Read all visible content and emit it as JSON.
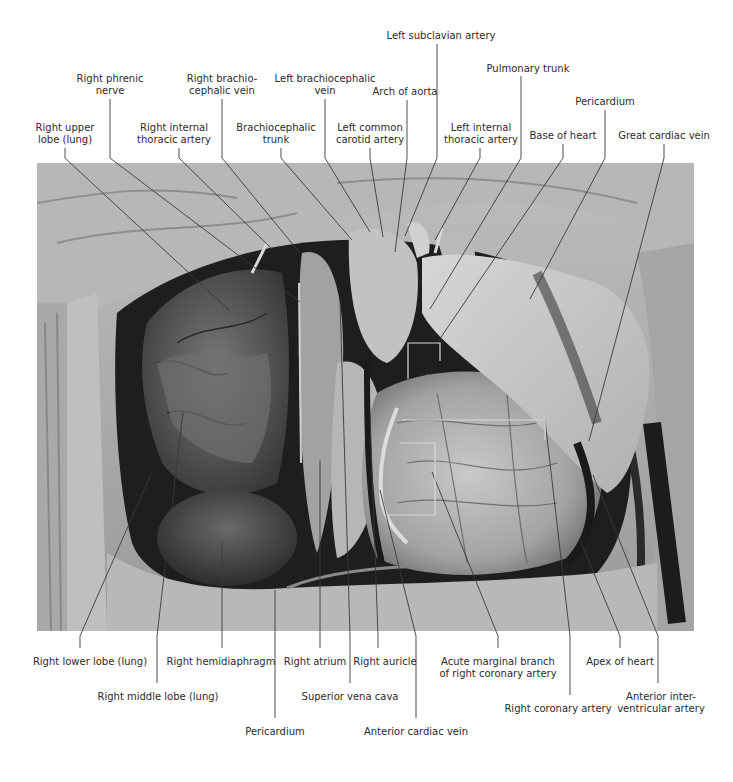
{
  "figure": {
    "colors": {
      "background": "#ffffff",
      "leader_line": "#3a3a3a",
      "label_text": "#2b2b2b"
    }
  },
  "labels": {
    "top": [
      {
        "id": "right-upper-lobe",
        "lines": [
          "Right upper",
          "lobe (lung)"
        ],
        "x": 65,
        "y": 122
      },
      {
        "id": "right-phrenic-nerve",
        "lines": [
          "Right phrenic",
          "nerve"
        ],
        "x": 110,
        "y": 73
      },
      {
        "id": "right-internal-thoracic-artery",
        "lines": [
          "Right internal",
          "thoracic artery"
        ],
        "x": 174,
        "y": 122
      },
      {
        "id": "right-brachiocephalic-vein",
        "lines": [
          "Right brachio-",
          "cephalic vein"
        ],
        "x": 222,
        "y": 73
      },
      {
        "id": "brachiocephalic-trunk",
        "lines": [
          "Brachiocephalic",
          "trunk"
        ],
        "x": 276,
        "y": 122
      },
      {
        "id": "left-brachiocephalic-vein",
        "lines": [
          "Left brachiocephalic",
          "vein"
        ],
        "x": 325,
        "y": 73
      },
      {
        "id": "left-common-carotid-artery",
        "lines": [
          "Left common",
          "carotid artery"
        ],
        "x": 370,
        "y": 122
      },
      {
        "id": "arch-of-aorta",
        "lines": [
          "Arch of aorta"
        ],
        "x": 405,
        "y": 86
      },
      {
        "id": "left-subclavian-artery",
        "lines": [
          "Left subclavian artery"
        ],
        "x": 441,
        "y": 30
      },
      {
        "id": "left-internal-thoracic-artery",
        "lines": [
          "Left internal",
          "thoracic artery"
        ],
        "x": 481,
        "y": 122
      },
      {
        "id": "pulmonary-trunk",
        "lines": [
          "Pulmonary trunk"
        ],
        "x": 528,
        "y": 63
      },
      {
        "id": "base-of-heart",
        "lines": [
          "Base of heart"
        ],
        "x": 563,
        "y": 130
      },
      {
        "id": "pericardium-top",
        "lines": [
          "Pericardium"
        ],
        "x": 605,
        "y": 96
      },
      {
        "id": "great-cardiac-vein",
        "lines": [
          "Great cardiac vein"
        ],
        "x": 664,
        "y": 130
      }
    ],
    "bottom": [
      {
        "id": "right-lower-lobe",
        "lines": [
          "Right lower lobe (lung)"
        ],
        "x": 90,
        "y": 656
      },
      {
        "id": "right-middle-lobe",
        "lines": [
          "Right middle lobe (lung)"
        ],
        "x": 158,
        "y": 691
      },
      {
        "id": "right-hemidiaphragm",
        "lines": [
          "Right hemidiaphragm"
        ],
        "x": 221,
        "y": 656
      },
      {
        "id": "pericardium-bottom",
        "lines": [
          "Pericardium"
        ],
        "x": 275,
        "y": 726
      },
      {
        "id": "right-atrium",
        "lines": [
          "Right atrium"
        ],
        "x": 315,
        "y": 656
      },
      {
        "id": "superior-vena-cava",
        "lines": [
          "Superior vena cava"
        ],
        "x": 350,
        "y": 691
      },
      {
        "id": "right-auricle",
        "lines": [
          "Right auricle"
        ],
        "x": 385,
        "y": 656
      },
      {
        "id": "anterior-cardiac-vein",
        "lines": [
          "Anterior cardiac vein"
        ],
        "x": 416,
        "y": 726
      },
      {
        "id": "acute-marginal-branch",
        "lines": [
          "Acute marginal branch",
          "of right coronary artery"
        ],
        "x": 498,
        "y": 656
      },
      {
        "id": "right-coronary-artery",
        "lines": [
          "Right coronary artery"
        ],
        "x": 558,
        "y": 703
      },
      {
        "id": "apex-of-heart",
        "lines": [
          "Apex of heart"
        ],
        "x": 620,
        "y": 656
      },
      {
        "id": "anterior-interventricular-artery",
        "lines": [
          "Anterior inter-",
          "ventricular artery"
        ],
        "x": 661,
        "y": 691
      }
    ]
  },
  "leaders": [
    "M65,148 L65,158 L230,311",
    "M110,99 L110,158 L300,302",
    "M179,148 L179,158 L272,249",
    "M222,99 L222,158 L299,252",
    "M281,148 L281,158 L352,240",
    "M325,99 L325,158 L370,232",
    "M370,148 L370,158 L383,237",
    "M407,100 L407,158 L395,252",
    "M437,44 L437,158 L405,236",
    "M480,148 L480,158 L435,240",
    "M521,76 L521,158 L430,309",
    "M563,144 L563,158 L437,343",
    "M605,110 L605,158 L530,299",
    "M664,144 L664,158 L589,441",
    "M80,648 L80,636 L151,474",
    "M157,683 L157,636 L183,412",
    "M222,648 L222,636 L222,542",
    "M275,718 L275,636 L275,590",
    "M320,648 L320,636 L320,460",
    "M350,683 L350,636 L340,301",
    "M378,648 L378,636 L370,414",
    "M416,718 L416,636 L380,490",
    "M498,648 L498,636 L432,472",
    "M570,695 L570,636 L545,420 L545,420",
    "M620,648 L620,636 L580,540",
    "M658,683 L658,636 L593,475"
  ],
  "brackets": [
    "M408,379 L408,343 L440,343 L440,361",
    "M402,420 L545,420 L545,440",
    "M400,443 L435,443 L435,515 L388,515"
  ]
}
